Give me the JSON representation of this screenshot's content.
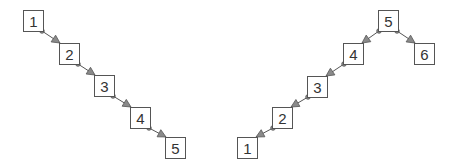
{
  "colors": {
    "stroke": "#555555",
    "text": "#333333",
    "box_fill": "#ffffff",
    "connector_fill": "#8a8a8a"
  },
  "trees": [
    {
      "name": "left-chain",
      "nodes": [
        {
          "id": "L1",
          "label": "1",
          "x": 23,
          "y": 10
        },
        {
          "id": "L2",
          "label": "2",
          "x": 59,
          "y": 43
        },
        {
          "id": "L3",
          "label": "3",
          "x": 94,
          "y": 75
        },
        {
          "id": "L4",
          "label": "4",
          "x": 130,
          "y": 107
        },
        {
          "id": "L5",
          "label": "5",
          "x": 165,
          "y": 137
        }
      ],
      "edges": [
        {
          "from": "L1",
          "to": "L2"
        },
        {
          "from": "L2",
          "to": "L3"
        },
        {
          "from": "L3",
          "to": "L4"
        },
        {
          "from": "L4",
          "to": "L5"
        }
      ]
    },
    {
      "name": "right-tree",
      "nodes": [
        {
          "id": "R5",
          "label": "5",
          "x": 378,
          "y": 10
        },
        {
          "id": "R4",
          "label": "4",
          "x": 343,
          "y": 43
        },
        {
          "id": "R6",
          "label": "6",
          "x": 414,
          "y": 43
        },
        {
          "id": "R3",
          "label": "3",
          "x": 307,
          "y": 76
        },
        {
          "id": "R2",
          "label": "2",
          "x": 272,
          "y": 107
        },
        {
          "id": "R1",
          "label": "1",
          "x": 237,
          "y": 137
        }
      ],
      "edges": [
        {
          "from": "R5",
          "to": "R4"
        },
        {
          "from": "R5",
          "to": "R6"
        },
        {
          "from": "R4",
          "to": "R3"
        },
        {
          "from": "R3",
          "to": "R2"
        },
        {
          "from": "R2",
          "to": "R1"
        }
      ]
    }
  ],
  "box": {
    "width": 20,
    "height": 21
  }
}
